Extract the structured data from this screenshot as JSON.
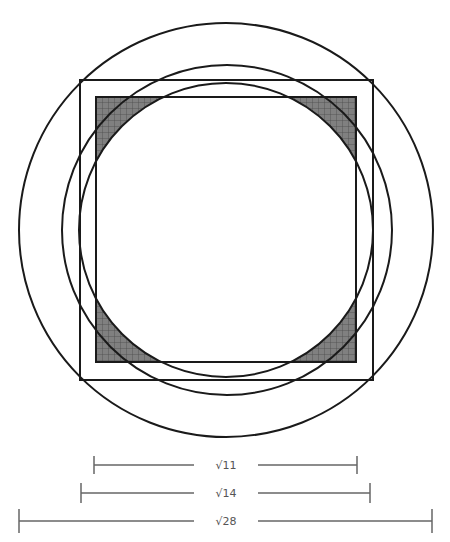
{
  "diagram": {
    "type": "geometry",
    "colors": {
      "stroke": "#1a1a1a",
      "shade": "#7a7a7a",
      "grid": "#4a4a4a",
      "measure": "#666666",
      "label": "#555555"
    },
    "circles": [
      {
        "name": "outer-circle",
        "cx": 226,
        "cy": 230,
        "r": 207
      },
      {
        "name": "middle-circle",
        "cx": 227,
        "cy": 230,
        "r": 165
      },
      {
        "name": "inner-circle",
        "cx": 226,
        "cy": 230,
        "r": 147
      }
    ],
    "squares": [
      {
        "name": "outer-square",
        "x": 80,
        "y": 80,
        "w": 293,
        "h": 300
      },
      {
        "name": "inner-square",
        "x": 96,
        "y": 97,
        "w": 260,
        "h": 265
      }
    ],
    "shaded_regions": "corners of inner square outside inner circle"
  },
  "measurements": [
    {
      "label": "√11",
      "y": 465,
      "x1": 94,
      "x2": 357
    },
    {
      "label": "√14",
      "y": 493,
      "x1": 81,
      "x2": 370
    },
    {
      "label": "√28",
      "y": 521,
      "x1": 19,
      "x2": 432
    }
  ]
}
